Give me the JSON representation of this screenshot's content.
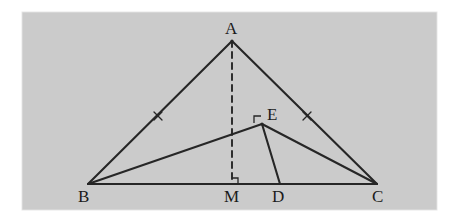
{
  "figure": {
    "type": "geometry-diagram",
    "canvas": {
      "width": 460,
      "height": 222
    },
    "plate": {
      "name": "diagram-plate",
      "x": 22,
      "y": 12,
      "width": 415,
      "height": 198,
      "fill": "#cccccc",
      "border_color": "#e8e8e8"
    },
    "colors": {
      "background": "#ffffff",
      "plate_fill": "#cccccc",
      "stroke": "#262626",
      "label_text": "#1b1b1b"
    },
    "stroke_width": 2.1,
    "points": [
      {
        "id": "A",
        "label": "A",
        "x": 232,
        "y": 41,
        "label_x": 225,
        "label_y": 20,
        "is_vertex": true
      },
      {
        "id": "B",
        "label": "B",
        "x": 88,
        "y": 184,
        "label_x": 78,
        "label_y": 188,
        "is_vertex": true
      },
      {
        "id": "C",
        "label": "C",
        "x": 377,
        "y": 184,
        "label_x": 372,
        "label_y": 188,
        "is_vertex": true
      },
      {
        "id": "M",
        "label": "M",
        "x": 232,
        "y": 184,
        "label_x": 224,
        "label_y": 188,
        "is_vertex": false
      },
      {
        "id": "D",
        "label": "D",
        "x": 280,
        "y": 184,
        "label_x": 272,
        "label_y": 188,
        "is_vertex": false
      },
      {
        "id": "E",
        "label": "E",
        "x": 262,
        "y": 124,
        "label_x": 267,
        "label_y": 106,
        "is_vertex": false
      }
    ],
    "segments": [
      {
        "name": "segment-AB",
        "from": "A",
        "to": "B",
        "style": "solid"
      },
      {
        "name": "segment-AC",
        "from": "A",
        "to": "C",
        "style": "solid"
      },
      {
        "name": "segment-BC",
        "from": "B",
        "to": "C",
        "style": "solid"
      },
      {
        "name": "segment-AM",
        "from": "A",
        "to": "M",
        "style": "dashed"
      },
      {
        "name": "segment-BE",
        "from": "B",
        "to": "E",
        "style": "solid"
      },
      {
        "name": "segment-EC",
        "from": "E",
        "to": "C",
        "style": "solid"
      },
      {
        "name": "segment-ED",
        "from": "E",
        "to": "D",
        "style": "solid"
      }
    ],
    "dash_pattern": "6,5",
    "tick_marks": [
      {
        "name": "congruence-tick-AB",
        "on_segment": "AB",
        "x": 158,
        "y": 116,
        "glyph": "x"
      },
      {
        "name": "congruence-tick-AC",
        "on_segment": "AC",
        "x": 307,
        "y": 116,
        "glyph": "x"
      }
    ],
    "right_angles": [
      {
        "name": "right-angle-at-M",
        "at": "M",
        "x": 232,
        "y": 184,
        "size": 6,
        "orientation": "up-right"
      },
      {
        "name": "right-angle-at-E",
        "at": "E",
        "x": 262,
        "y": 124,
        "size": 7,
        "orientation": "upper-left"
      }
    ]
  }
}
